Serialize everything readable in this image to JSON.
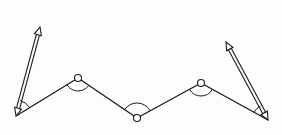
{
  "diagram": {
    "title": "",
    "colors": {
      "stroke": "#1a1a1a",
      "background": "#fdfdfd",
      "node_fill": "#ffffff"
    },
    "polyline": [
      {
        "id": "end-left",
        "x": 16,
        "y": 116
      },
      {
        "id": "joint-1",
        "x": 78,
        "y": 78
      },
      {
        "id": "joint-2",
        "x": 137,
        "y": 118
      },
      {
        "id": "joint-3",
        "x": 201,
        "y": 83
      },
      {
        "id": "end-right",
        "x": 268,
        "y": 120
      }
    ],
    "joints": [
      {
        "id": "joint-1",
        "x": 78,
        "y": 78,
        "r": 3.5
      },
      {
        "id": "joint-2",
        "x": 137,
        "y": 118,
        "r": 3.5
      },
      {
        "id": "joint-3",
        "x": 201,
        "y": 83,
        "r": 3.5
      }
    ],
    "arrows": [
      {
        "id": "arrow-left",
        "from": [
          16,
          116
        ],
        "to": [
          40,
          27
        ]
      },
      {
        "id": "arrow-right",
        "from": [
          268,
          120
        ],
        "to": [
          226,
          42
        ]
      }
    ],
    "angle_arcs": [
      {
        "id": "angle-end-left",
        "at": "end-left"
      },
      {
        "id": "angle-joint-1",
        "at": "joint-1"
      },
      {
        "id": "angle-joint-2",
        "at": "joint-2"
      },
      {
        "id": "angle-joint-3",
        "at": "joint-3"
      },
      {
        "id": "angle-end-right",
        "at": "end-right"
      }
    ]
  }
}
